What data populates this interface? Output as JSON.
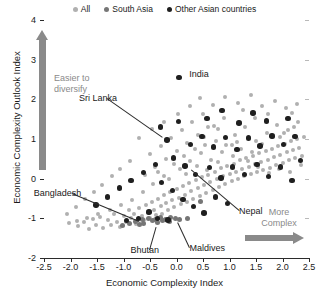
{
  "legend": {
    "position": "top-center",
    "items": [
      {
        "label": "All",
        "color": "#b0b0b0",
        "key": "all"
      },
      {
        "label": "South Asia",
        "color": "#767676",
        "key": "south"
      },
      {
        "label": "Other Asian countries",
        "color": "#1f1f1f",
        "key": "other"
      }
    ]
  },
  "annotations": {
    "easier": "Easier to\ndiversify",
    "easier_line1": "Easier to",
    "easier_line2": "diversify",
    "more_line1": "More",
    "more_line2": "Complex",
    "up_arrow": "up-arrow-icon",
    "right_arrow": "right-arrow-icon"
  },
  "chart_data": {
    "type": "scatter",
    "title": "",
    "xlabel": "Economic Complexity Index",
    "ylabel": "Economic Complexity Outlook Index",
    "xlim": [
      -2.5,
      2.5
    ],
    "ylim": [
      -2,
      4
    ],
    "xticks": [
      -2.5,
      -2.0,
      -1.5,
      -1.0,
      -0.5,
      0.0,
      0.5,
      1.0,
      1.5,
      2.0,
      2.5
    ],
    "xticklabels": [
      "-2.5",
      "-2.0",
      "-1.5",
      "-1.0",
      "-0.5",
      "0.0",
      "0.5",
      "1.0",
      "1.5",
      "2.0",
      "2.5"
    ],
    "yticks": [
      -2,
      -1,
      0,
      1,
      2,
      3,
      4
    ],
    "yticklabels": [
      "-2",
      "-1",
      "0",
      "1",
      "2",
      "3",
      "4"
    ],
    "grid": false,
    "legend_position": "top-center",
    "series": [
      {
        "name": "All",
        "color": "#b0b0b0",
        "marker_size": 4,
        "points": [
          [
            -2.02,
            -1.12
          ],
          [
            -1.86,
            -1.2
          ],
          [
            -1.74,
            -1.08
          ],
          [
            -1.66,
            -1.27
          ],
          [
            -1.58,
            -1.02
          ],
          [
            -1.52,
            -1.18
          ],
          [
            -1.44,
            -0.96
          ],
          [
            -1.38,
            -1.24
          ],
          [
            -1.3,
            -1.05
          ],
          [
            -1.24,
            -1.16
          ],
          [
            -1.18,
            -0.9
          ],
          [
            -1.12,
            -1.1
          ],
          [
            -1.06,
            -1.22
          ],
          [
            -1.0,
            -0.95
          ],
          [
            -0.96,
            -1.08
          ],
          [
            -0.9,
            -0.8
          ],
          [
            -0.86,
            -1.0
          ],
          [
            -0.8,
            -0.88
          ],
          [
            -0.76,
            -1.14
          ],
          [
            -0.7,
            -0.74
          ],
          [
            -0.66,
            -0.94
          ],
          [
            -0.62,
            -1.05
          ],
          [
            -0.58,
            -0.66
          ],
          [
            -0.54,
            -0.86
          ],
          [
            -0.5,
            -1.0
          ],
          [
            -0.46,
            -0.58
          ],
          [
            -0.42,
            -0.78
          ],
          [
            -0.38,
            -0.92
          ],
          [
            -0.34,
            -0.5
          ],
          [
            -0.3,
            -0.7
          ],
          [
            -0.28,
            -0.88
          ],
          [
            -0.24,
            -0.42
          ],
          [
            -0.2,
            -0.62
          ],
          [
            -0.16,
            -0.8
          ],
          [
            -0.12,
            -0.34
          ],
          [
            -0.08,
            -0.55
          ],
          [
            -0.04,
            -0.72
          ],
          [
            0.0,
            -0.26
          ],
          [
            0.04,
            -0.48
          ],
          [
            0.08,
            -0.64
          ],
          [
            0.12,
            -0.18
          ],
          [
            0.16,
            -0.4
          ],
          [
            0.2,
            -0.58
          ],
          [
            0.24,
            -0.1
          ],
          [
            0.28,
            -0.32
          ],
          [
            0.32,
            -0.5
          ],
          [
            0.36,
            -0.04
          ],
          [
            0.4,
            -0.24
          ],
          [
            0.44,
            -0.44
          ],
          [
            0.48,
            0.04
          ],
          [
            0.52,
            -0.16
          ],
          [
            0.56,
            -0.36
          ],
          [
            0.6,
            0.1
          ],
          [
            0.64,
            -0.08
          ],
          [
            0.68,
            -0.28
          ],
          [
            0.72,
            0.18
          ],
          [
            0.76,
            0.0
          ],
          [
            0.8,
            -0.2
          ],
          [
            0.84,
            0.26
          ],
          [
            0.88,
            0.06
          ],
          [
            0.92,
            -0.14
          ],
          [
            0.96,
            0.32
          ],
          [
            1.0,
            0.12
          ],
          [
            1.04,
            -0.06
          ],
          [
            1.08,
            0.38
          ],
          [
            1.12,
            0.18
          ],
          [
            1.16,
            0.0
          ],
          [
            1.2,
            0.46
          ],
          [
            1.24,
            0.24
          ],
          [
            1.28,
            0.06
          ],
          [
            1.32,
            0.52
          ],
          [
            1.36,
            0.3
          ],
          [
            1.4,
            0.12
          ],
          [
            1.44,
            0.58
          ],
          [
            1.48,
            0.36
          ],
          [
            1.52,
            0.18
          ],
          [
            1.56,
            0.64
          ],
          [
            1.6,
            0.42
          ],
          [
            1.64,
            0.22
          ],
          [
            1.68,
            0.7
          ],
          [
            1.72,
            0.48
          ],
          [
            1.76,
            0.28
          ],
          [
            1.8,
            0.76
          ],
          [
            1.84,
            0.54
          ],
          [
            1.88,
            0.34
          ],
          [
            1.92,
            0.82
          ],
          [
            1.96,
            0.6
          ],
          [
            2.0,
            0.4
          ],
          [
            2.04,
            0.88
          ],
          [
            2.08,
            0.66
          ],
          [
            2.12,
            0.46
          ],
          [
            2.16,
            0.94
          ],
          [
            2.2,
            0.72
          ],
          [
            2.24,
            0.52
          ],
          [
            2.28,
            1.0
          ],
          [
            2.32,
            0.78
          ],
          [
            2.36,
            0.58
          ],
          [
            2.4,
            1.06
          ],
          [
            -0.6,
            0.1
          ],
          [
            -0.4,
            0.3
          ],
          [
            -0.2,
            0.5
          ],
          [
            0.0,
            0.7
          ],
          [
            0.2,
            0.9
          ],
          [
            0.4,
            1.1
          ],
          [
            0.6,
            1.3
          ],
          [
            -0.5,
            0.62
          ],
          [
            -0.3,
            0.82
          ],
          [
            -0.1,
            1.02
          ],
          [
            0.1,
            1.22
          ],
          [
            0.3,
            1.42
          ],
          [
            0.5,
            1.62
          ],
          [
            0.7,
            1.34
          ],
          [
            0.9,
            1.54
          ],
          [
            1.1,
            1.1
          ],
          [
            1.3,
            1.3
          ],
          [
            1.5,
            0.96
          ],
          [
            1.7,
            1.16
          ],
          [
            1.9,
            1.36
          ],
          [
            2.1,
            1.22
          ],
          [
            2.3,
            1.42
          ],
          [
            -0.7,
            1.02
          ],
          [
            -0.46,
            1.24
          ],
          [
            -0.24,
            1.44
          ],
          [
            0.02,
            1.64
          ],
          [
            0.26,
            1.84
          ],
          [
            0.52,
            1.04
          ],
          [
            0.78,
            1.24
          ],
          [
            1.04,
            0.84
          ],
          [
            1.26,
            1.72
          ],
          [
            1.48,
            1.52
          ],
          [
            1.72,
            1.62
          ],
          [
            1.96,
            1.06
          ],
          [
            2.18,
            1.66
          ],
          [
            0.44,
            2.04
          ],
          [
            0.68,
            1.86
          ],
          [
            0.92,
            2.06
          ],
          [
            1.16,
            1.92
          ],
          [
            1.4,
            2.12
          ],
          [
            1.62,
            1.82
          ],
          [
            1.86,
            1.96
          ],
          [
            2.06,
            1.78
          ],
          [
            2.28,
            1.88
          ],
          [
            -0.88,
            0.44
          ],
          [
            -1.06,
            0.24
          ],
          [
            -1.22,
            0.06
          ],
          [
            -1.4,
            -0.16
          ],
          [
            -1.56,
            -0.34
          ],
          [
            -1.72,
            -0.52
          ],
          [
            -1.9,
            -0.72
          ],
          [
            -2.06,
            -0.88
          ],
          [
            -0.34,
            0.16
          ],
          [
            -0.14,
            -0.02
          ],
          [
            0.06,
            0.24
          ],
          [
            0.26,
            0.44
          ],
          [
            0.46,
            0.64
          ],
          [
            0.66,
            0.46
          ],
          [
            0.86,
            0.66
          ],
          [
            1.06,
            0.56
          ],
          [
            1.22,
            0.76
          ],
          [
            1.42,
            0.68
          ],
          [
            1.62,
            0.88
          ],
          [
            1.82,
            1.04
          ],
          [
            2.02,
            1.14
          ],
          [
            2.22,
            1.3
          ],
          [
            0.14,
            0.56
          ],
          [
            0.34,
            0.76
          ],
          [
            0.54,
            0.86
          ],
          [
            0.74,
            0.96
          ],
          [
            0.94,
            0.86
          ],
          [
            1.14,
            0.92
          ],
          [
            -0.04,
            0.36
          ],
          [
            -0.24,
            0.06
          ],
          [
            -0.44,
            -0.14
          ],
          [
            -0.64,
            -0.34
          ],
          [
            -0.84,
            -0.54
          ],
          [
            -1.04,
            -0.66
          ],
          [
            -1.26,
            -0.78
          ],
          [
            -1.48,
            -0.9
          ],
          [
            -1.68,
            -1.0
          ],
          [
            -1.88,
            -1.06
          ],
          [
            1.34,
            0.44
          ],
          [
            1.54,
            0.3
          ],
          [
            1.74,
            0.14
          ],
          [
            1.94,
            0.24
          ],
          [
            2.14,
            0.18
          ],
          [
            2.34,
            0.34
          ],
          [
            0.18,
            0.12
          ],
          [
            0.38,
            0.32
          ],
          [
            0.58,
            0.22
          ],
          [
            0.78,
            0.42
          ]
        ]
      },
      {
        "name": "South Asia",
        "color": "#767676",
        "marker_size": 5,
        "points": [
          [
            -0.78,
            -1.08
          ],
          [
            -0.64,
            -1.04
          ],
          [
            -0.52,
            -1.0
          ],
          [
            -0.4,
            -1.02
          ],
          [
            -0.3,
            -0.98
          ],
          [
            -0.2,
            -1.02
          ],
          [
            -0.12,
            -0.98
          ],
          [
            -0.02,
            -1.0
          ],
          [
            -0.62,
            -1.12
          ],
          [
            -0.36,
            -1.1
          ],
          [
            -0.14,
            -1.08
          ],
          [
            -0.88,
            -1.14
          ],
          [
            0.06,
            -1.04
          ],
          [
            -0.46,
            -1.06
          ],
          [
            -0.26,
            -1.06
          ],
          [
            0.46,
            -0.58
          ],
          [
            -0.7,
            -1.16
          ],
          [
            0.2,
            -1.0
          ],
          [
            -1.02,
            -1.18
          ]
        ]
      },
      {
        "name": "Other Asian countries",
        "color": "#1f1f1f",
        "marker_size": 5.5,
        "points": [
          [
            0.05,
            2.55
          ],
          [
            -0.18,
            0.98
          ],
          [
            -0.06,
            0.52
          ],
          [
            0.16,
            0.32
          ],
          [
            0.36,
            0.1
          ],
          [
            0.62,
            0.28
          ],
          [
            0.84,
            0.02
          ],
          [
            1.06,
            0.3
          ],
          [
            1.28,
            0.1
          ],
          [
            1.52,
            0.36
          ],
          [
            1.74,
            0.06
          ],
          [
            1.96,
            0.3
          ],
          [
            2.18,
            -0.04
          ],
          [
            2.34,
            0.46
          ],
          [
            -0.4,
            0.36
          ],
          [
            -0.62,
            0.16
          ],
          [
            -0.86,
            -0.04
          ],
          [
            -1.08,
            -0.24
          ],
          [
            -1.3,
            -0.46
          ],
          [
            -1.52,
            -0.66
          ],
          [
            0.26,
            0.86
          ],
          [
            0.48,
            1.06
          ],
          [
            0.7,
            0.8
          ],
          [
            0.92,
            1.04
          ],
          [
            1.14,
            0.74
          ],
          [
            1.36,
            1.02
          ],
          [
            1.58,
            0.82
          ],
          [
            1.8,
            1.08
          ],
          [
            2.02,
            0.86
          ],
          [
            2.24,
            1.06
          ],
          [
            -0.28,
            -0.1
          ],
          [
            -0.08,
            -0.3
          ],
          [
            0.12,
            -0.52
          ],
          [
            0.32,
            -0.7
          ],
          [
            0.52,
            -0.86
          ],
          [
            -0.52,
            -0.84
          ],
          [
            -0.72,
            -1.0
          ],
          [
            -0.94,
            -1.06
          ],
          [
            0.74,
            -0.46
          ],
          [
            0.96,
            -0.62
          ],
          [
            0.04,
            1.44
          ],
          [
            0.58,
            1.52
          ],
          [
            1.18,
            1.4
          ],
          [
            1.7,
            1.46
          ],
          [
            2.1,
            1.52
          ],
          [
            -0.3,
            1.3
          ],
          [
            0.86,
            1.72
          ],
          [
            1.44,
            1.66
          ],
          [
            -0.16,
            -1.04
          ],
          [
            -0.36,
            -1.0
          ]
        ]
      }
    ],
    "labeled_points": [
      {
        "name": "India",
        "x": 0.05,
        "y": 2.55,
        "label_dx": 10,
        "label_dy": -4,
        "leader": false
      },
      {
        "name": "Sri Lanka",
        "x": -0.18,
        "y": 0.98,
        "label_dx": -60,
        "label_dy": -42,
        "leader": true
      },
      {
        "name": "Bangladesh",
        "x": -0.62,
        "y": -1.12,
        "label_dx": -72,
        "label_dy": -30,
        "leader": true
      },
      {
        "name": "Bhutan",
        "x": -0.36,
        "y": -1.1,
        "label_dx": -8,
        "label_dy": 28,
        "leader": true
      },
      {
        "name": "Maldives",
        "x": -0.02,
        "y": -1.0,
        "label_dx": 14,
        "label_dy": 30,
        "leader": true
      },
      {
        "name": "Nepal",
        "x": 0.2,
        "y": 0.3,
        "label_dx": 52,
        "label_dy": 44,
        "leader": true
      }
    ]
  }
}
